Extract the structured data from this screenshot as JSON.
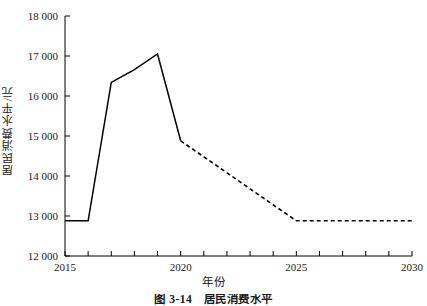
{
  "chart_data": {
    "type": "line",
    "title": "",
    "xlabel": "年份",
    "ylabel": "居民消费水平/元",
    "caption": "图 3-14　居民消费水平",
    "xlim": [
      2015,
      2030
    ],
    "ylim": [
      12000,
      18000
    ],
    "grid": false,
    "legend_position": "none",
    "x_tick_values": [
      2015,
      2016,
      2017,
      2018,
      2019,
      2020,
      2021,
      2022,
      2023,
      2024,
      2025,
      2026,
      2027,
      2028,
      2029,
      2030
    ],
    "x_tick_labels": [
      "2015",
      "",
      "",
      "",
      "",
      "2020",
      "",
      "",
      "",
      "",
      "2025",
      "",
      "",
      "",
      "",
      "2030"
    ],
    "y_tick_values": [
      12000,
      13000,
      14000,
      15000,
      16000,
      17000,
      18000
    ],
    "y_tick_labels": [
      "12 000",
      "13 000",
      "14 000",
      "15 000",
      "16 000",
      "17 000",
      "18 000"
    ],
    "line_color": "#000000",
    "series": [
      {
        "name": "历史值",
        "style": "solid",
        "x": [
          2015,
          2016,
          2017,
          2018,
          2019,
          2020
        ],
        "values": [
          12880,
          12880,
          16340,
          16660,
          17050,
          14880
        ]
      },
      {
        "name": "预测值",
        "style": "dashed",
        "x": [
          2020,
          2021,
          2022,
          2023,
          2024,
          2025,
          2026,
          2027,
          2028,
          2029,
          2030
        ],
        "values": [
          14880,
          14480,
          14080,
          13680,
          13280,
          12880,
          12880,
          12880,
          12880,
          12880,
          12880
        ]
      }
    ]
  }
}
